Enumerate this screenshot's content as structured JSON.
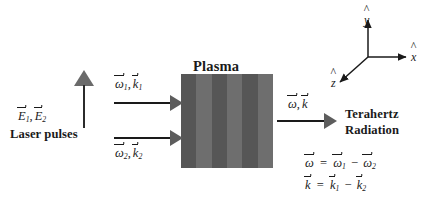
{
  "figure": {
    "type": "schematic"
  },
  "plasma": {
    "label": "Plasma",
    "stripe_count": 6,
    "color_dark": "#565656",
    "color_light": "#6e6e6e"
  },
  "laser": {
    "field_symbol": "E",
    "field_sub_1": "1",
    "field_sub_2": "2",
    "separator": ",",
    "caption": "Laser pulses"
  },
  "beam_in_1": {
    "omega": "ω",
    "omega_sub": "1",
    "k": "k",
    "k_sub": "1",
    "separator": ","
  },
  "beam_in_2": {
    "omega": "ω",
    "omega_sub": "2",
    "k": "k",
    "k_sub": "2",
    "separator": ","
  },
  "beam_out": {
    "omega": "ω",
    "k": "k",
    "separator": ",",
    "caption_line1": "Terahertz",
    "caption_line2": "Radiation"
  },
  "equations": {
    "omega_lhs": "ω",
    "omega_eq": "=",
    "omega_t1": "ω",
    "omega_t1_sub": "1",
    "omega_minus": "−",
    "omega_t2": "ω",
    "omega_t2_sub": "2",
    "k_lhs": "k",
    "k_eq": "=",
    "k_t1": "k",
    "k_t1_sub": "1",
    "k_minus": "−",
    "k_t2": "k",
    "k_t2_sub": "2"
  },
  "axes": {
    "x_label": "x",
    "y_label": "y",
    "z_label": "z"
  },
  "colors": {
    "background": "#ffffff",
    "ink": "#1a1a1a",
    "arrow_gray": "#5d5d5d",
    "efield_gray": "#6a6a6a"
  }
}
